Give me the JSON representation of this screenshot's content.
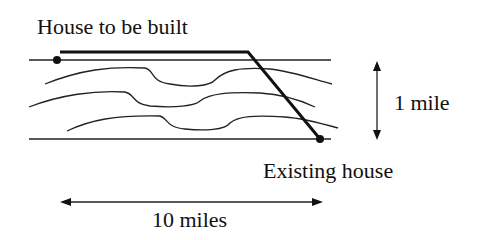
{
  "diagram": {
    "labels": {
      "new_house": "House to be built",
      "existing_house": "Existing house",
      "width_dim": "1 mile",
      "length_dim": "10 miles"
    },
    "colors": {
      "ink": "#111111",
      "background": "#ffffff"
    },
    "elements": {
      "river_banks": 2,
      "contour_lines": 3,
      "pipeline_segments": [
        "along bank",
        "diagonal across river"
      ]
    }
  }
}
